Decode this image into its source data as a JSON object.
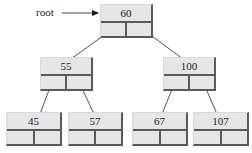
{
  "diagram": {
    "type": "binary-search-tree",
    "root_label": "root",
    "nodes": {
      "n60": {
        "value": "60"
      },
      "n55": {
        "value": "55"
      },
      "n100": {
        "value": "100"
      },
      "n45": {
        "value": "45"
      },
      "n57": {
        "value": "57"
      },
      "n67": {
        "value": "67"
      },
      "n107": {
        "value": "107"
      }
    },
    "edges": [
      {
        "from": "60",
        "to": "55"
      },
      {
        "from": "60",
        "to": "100"
      },
      {
        "from": "55",
        "to": "45"
      },
      {
        "from": "55",
        "to": "57"
      },
      {
        "from": "100",
        "to": "67"
      },
      {
        "from": "100",
        "to": "107"
      }
    ],
    "colors": {
      "node_fill": "#e6e6e6",
      "node_border": "#5a5a5a",
      "edge": "#555555",
      "text": "#1a1a1a"
    }
  }
}
